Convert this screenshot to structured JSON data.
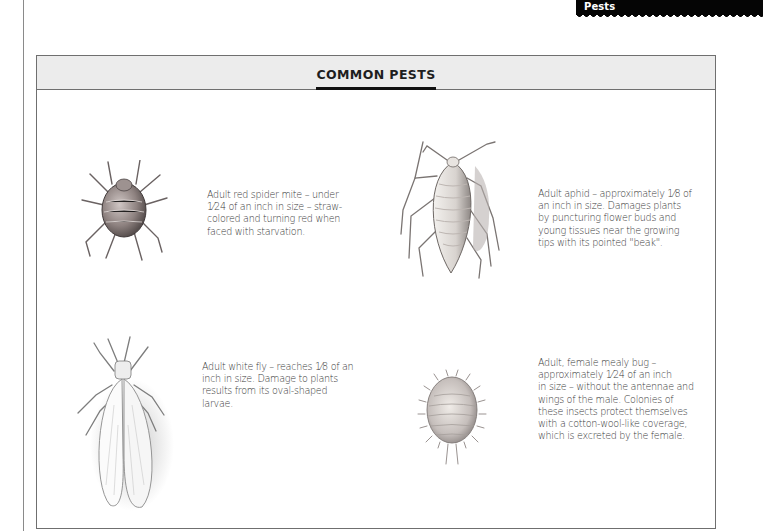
{
  "section_tab": {
    "label": "Pests"
  },
  "panel": {
    "title": "COMMON PESTS",
    "entries": [
      {
        "illustration": "red-spider-mite",
        "caption": "Adult red spider mite – under 1⁄24 of an inch in size – straw-colored and turning red when faced with starvation.",
        "lines": [
          "Adult red spider mite – under",
          "1⁄24 of an inch in size – straw-",
          "colored and turning red when",
          "faced with starvation."
        ]
      },
      {
        "illustration": "aphid",
        "caption": "Adult aphid – approximately 1⁄8 of an inch in size. Damages plants by puncturing flower buds and young tissues near the growing tips with its pointed \"beak\".",
        "lines": [
          "Adult aphid – approximately 1⁄8 of",
          "an inch in size. Damages plants",
          "by puncturing flower buds and",
          "young tissues near the growing",
          "tips with its pointed \"beak\"."
        ]
      },
      {
        "illustration": "white-fly",
        "caption": "Adult white fly – reaches 1⁄8 of an inch in size. Damage to plants results from its oval-shaped larvae.",
        "lines": [
          "Adult white fly – reaches 1⁄8 of an",
          "inch in size. Damage to plants",
          "results from its oval-shaped",
          "larvae."
        ]
      },
      {
        "illustration": "mealy-bug",
        "caption": "Adult, female mealy bug – approximately 1⁄24 of an inch in size – without the antennae and wings of the male. Colonies of these insects protect themselves with a cotton-wool-like coverage, which is excreted by the female.",
        "lines": [
          "Adult, female mealy bug –",
          "approximately 1⁄24 of an inch",
          "in size – without the antennae and",
          "wings of the male. Colonies of",
          "these insects protect themselves",
          "with a cotton-wool-like coverage,",
          "which is excreted by the female."
        ]
      }
    ]
  },
  "colors": {
    "tab": "#050505",
    "header_band": "#ececec",
    "border": "#6f6f6f",
    "text": "#3a3a3a"
  }
}
